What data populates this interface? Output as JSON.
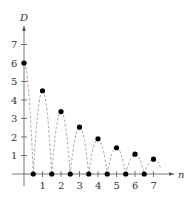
{
  "chart_data": {
    "type": "scatter",
    "title": "",
    "xlabel": "n",
    "ylabel": "D",
    "xlim": [
      0,
      7.5
    ],
    "ylim": [
      0,
      7.5
    ],
    "x_ticks": [
      "1",
      "2",
      "3",
      "4",
      "5",
      "6",
      "7"
    ],
    "y_ticks": [
      "1",
      "2",
      "3",
      "4",
      "5",
      "6",
      "7"
    ],
    "grid": false,
    "legend": null,
    "series": [
      {
        "name": "peaks",
        "x": [
          0,
          1,
          2,
          3,
          4,
          5,
          6,
          7
        ],
        "y": [
          6,
          4.5,
          3.375,
          2.53,
          1.9,
          1.42,
          1.07,
          0.8
        ]
      },
      {
        "name": "ground contacts",
        "x": [
          0.5,
          1.5,
          2.5,
          3.5,
          4.5,
          5.5,
          6.5
        ],
        "y": [
          0,
          0,
          0,
          0,
          0,
          0,
          0
        ]
      }
    ],
    "annotations": "Dashed parabolic arcs connect each ground contact to the peaks (bouncing ball, ratio 0.75)"
  },
  "colors": {
    "axis": "#555555",
    "dot": "#000000",
    "arc": "#999999"
  }
}
